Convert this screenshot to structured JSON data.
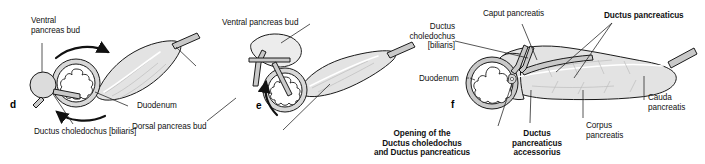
{
  "figure": {
    "panels": [
      {
        "letter": "d",
        "labels": [
          {
            "name": "ventral-pancreas-bud",
            "text": "Ventral\npancreas bud"
          },
          {
            "name": "duodenum",
            "text": "Duodenum"
          },
          {
            "name": "ductus-choledochus-biliaris",
            "text": "Ductus choledochus [biliaris]"
          }
        ]
      },
      {
        "letter": "e",
        "labels": [
          {
            "name": "ventral-pancreas-bud",
            "text": "Ventral pancreas bud"
          },
          {
            "name": "dorsal-pancreas-bud",
            "text": "Dorsal pancreas bud"
          }
        ]
      },
      {
        "letter": "f",
        "labels": [
          {
            "name": "ductus-choledochus-biliaris",
            "text": "Ductus\ncholedochus\n[biliaris]"
          },
          {
            "name": "caput-pancreatis",
            "text": "Caput pancreatis"
          },
          {
            "name": "ductus-pancreaticus",
            "text": "Ductus pancreaticus"
          },
          {
            "name": "duodenum",
            "text": "Duodenum"
          },
          {
            "name": "cauda-pancreatis",
            "text": "Cauda\npancreatis"
          },
          {
            "name": "corpus-pancreatis",
            "text": "Corpus\npancreatis"
          },
          {
            "name": "opening-of-ducts",
            "text": "Opening of the\nDuctus choledochus\nand Ductus pancreaticus"
          },
          {
            "name": "ductus-pancreaticus-accessorius",
            "text": "Ductus\npancreaticus\naccessorius"
          }
        ]
      }
    ],
    "panel_d": {
      "letter": "d",
      "ventral_pancreas_bud": "Ventral\npancreas bud",
      "duodenum": "Duodenum",
      "ductus_choledochus": "Ductus choledochus [biliaris]"
    },
    "panel_e": {
      "letter": "e",
      "ventral_pancreas_bud": "Ventral pancreas bud",
      "dorsal_pancreas_bud": "Dorsal pancreas bud"
    },
    "panel_f": {
      "letter": "f",
      "ductus_choledochus": "Ductus\ncholedochus\n[biliaris]",
      "caput_pancreatis": "Caput pancreatis",
      "ductus_pancreaticus": "Ductus pancreaticus",
      "duodenum": "Duodenum",
      "cauda_pancreatis": "Cauda\npancreatis",
      "corpus_pancreatis": "Corpus\npancreatis",
      "opening_of_ducts": "Opening of the\nDuctus choledochus\nand Ductus pancreaticus",
      "ductus_pancreaticus_accessorius": "Ductus\npancreaticus\naccessorius"
    },
    "colors": {
      "background": "#ffffff",
      "outline": "#1a1a1a",
      "organ_fill": "#e3e3e3",
      "organ_fill_light": "#efefef",
      "duct_wall": "#b8b8b8",
      "leader_line": "#2b2b2b",
      "text": "#111111"
    }
  }
}
